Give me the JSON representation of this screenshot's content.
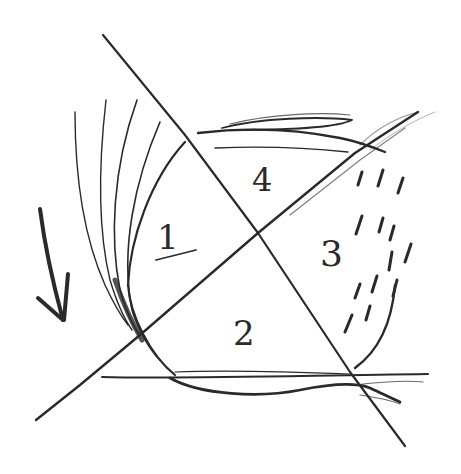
{
  "diagram": {
    "type": "pencil-sketch",
    "ink_color": "#2a2a2a",
    "background": "#ffffff",
    "regions": [
      {
        "id": "1",
        "label": "1",
        "underlined": true,
        "position": "left"
      },
      {
        "id": "2",
        "label": "2",
        "underlined": false,
        "position": "bottom"
      },
      {
        "id": "3",
        "label": "3",
        "underlined": false,
        "position": "right"
      },
      {
        "id": "4",
        "label": "4",
        "underlined": false,
        "position": "top"
      }
    ],
    "arrow": {
      "direction": "down",
      "position": "far-left"
    }
  }
}
